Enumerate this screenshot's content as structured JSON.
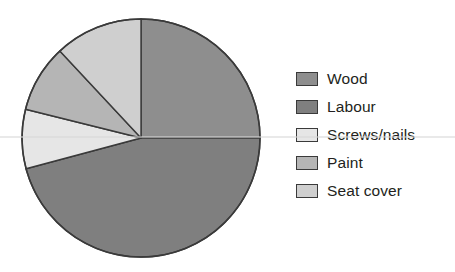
{
  "chart_data": {
    "type": "pie",
    "title": "",
    "xlabel": "",
    "ylabel": "",
    "legend_position": "right",
    "grid": false,
    "start_angle_deg": 0,
    "direction": "clockwise",
    "center": {
      "x": 141,
      "y": 138
    },
    "radius": 119,
    "categories": [
      "Wood",
      "Labour",
      "Screws/nails",
      "Paint",
      "Seat cover"
    ],
    "values": [
      25,
      46,
      8,
      9,
      12
    ],
    "units": "percent",
    "slices": [
      {
        "label": "Wood",
        "value": 25,
        "color": "#8e8e8e",
        "start_deg": 0,
        "end_deg": 90
      },
      {
        "label": "Labour",
        "value": 46,
        "color": "#7f7f7f",
        "start_deg": 90,
        "end_deg": 255
      },
      {
        "label": "Screws/nails",
        "value": 8,
        "color": "#e6e6e6",
        "start_deg": 255,
        "end_deg": 284
      },
      {
        "label": "Paint",
        "value": 9,
        "color": "#b5b5b5",
        "start_deg": 284,
        "end_deg": 317
      },
      {
        "label": "Seat cover",
        "value": 12,
        "color": "#cfcfcf",
        "start_deg": 317,
        "end_deg": 360
      }
    ],
    "outline_color": "#3a3a3a"
  },
  "legend": {
    "items": [
      {
        "label": "Wood",
        "color": "#8e8e8e"
      },
      {
        "label": "Labour",
        "color": "#7f7f7f"
      },
      {
        "label": "Screws/nails",
        "color": "#e6e6e6"
      },
      {
        "label": "Paint",
        "color": "#b5b5b5"
      },
      {
        "label": "Seat cover",
        "color": "#cfcfcf"
      }
    ]
  }
}
